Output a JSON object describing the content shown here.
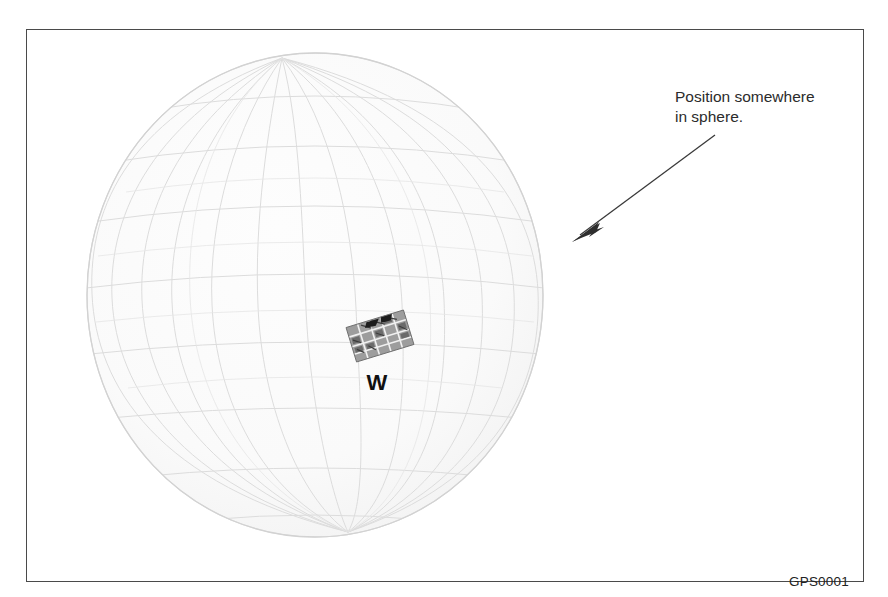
{
  "figure": {
    "id_label": "GPS0001",
    "frame": {
      "border_color": "#4a4a4a",
      "background": "#ffffff"
    }
  },
  "sphere": {
    "name": "wireframe-globe",
    "center_x": 314,
    "center_y": 294,
    "radius": 229,
    "outline_color": "#d8d8d8",
    "grid_color": "#dcdcdc",
    "fill_color": "#fbfbfb",
    "meridian_count": 12,
    "parallel_count": 8
  },
  "marker": {
    "label": "W",
    "label_color": "#111111",
    "patch_name": "street-map-patch",
    "patch_fill": "#9a9a9a",
    "patch_line": "#5f5f5f",
    "patch_rotation_deg": -17
  },
  "callout": {
    "text": "Position somewhere\nin sphere.",
    "line1": "Position somewhere",
    "line2": "in sphere.",
    "text_color": "#2b2b2b",
    "arrow_color": "#3a3a3a",
    "arrow_from_x": 688,
    "arrow_from_y": 105,
    "arrow_to_x": 545,
    "arrow_to_y": 212
  }
}
